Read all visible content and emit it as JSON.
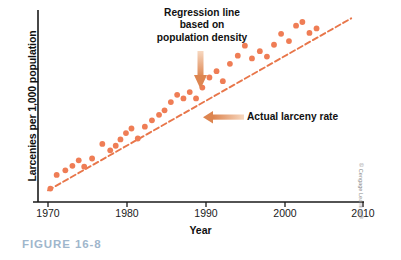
{
  "figure": {
    "caption": "FIGURE 16-8",
    "credit": "© Cengage Learning®"
  },
  "annotations": {
    "regression_line_label": "Regression line based on population density",
    "regression_line_label_line1": "Regression line",
    "regression_line_label_line2": "based on",
    "regression_line_label_line3": "population density",
    "actual_rate_label": "Actual larceny rate"
  },
  "colors": {
    "point": "#ef7d55",
    "line": "#e8764a",
    "arrow_start": "#f6d3ba",
    "arrow_end": "#e08a52",
    "axis": "#1a1a1a",
    "caption": "#9fb6cc",
    "text": "#111111"
  },
  "chart_data": {
    "type": "scatter",
    "title": "",
    "xlabel": "Year",
    "ylabel": "Larcenies per 1,000 population",
    "xlim": [
      1970,
      2010
    ],
    "ylim": [
      0,
      100
    ],
    "grid": false,
    "legend": "none",
    "xticks": [
      1970,
      1980,
      1990,
      2000,
      2010
    ],
    "xtick_labels": [
      "1970",
      "1980",
      "1990",
      "2000",
      "2010"
    ],
    "yticks": [],
    "ytick_labels": [],
    "series": [
      {
        "name": "Actual larceny rate",
        "type": "scatter",
        "x": [
          1970.3,
          1971.1,
          1972.2,
          1973.1,
          1973.9,
          1974.6,
          1975.6,
          1976.9,
          1977.9,
          1978.6,
          1979.2,
          1979.9,
          1980.6,
          1981.4,
          1982.3,
          1983.2,
          1984.1,
          1984.8,
          1985.6,
          1986.4,
          1987.2,
          1988.0,
          1988.8,
          1989.6,
          1990.5,
          1991.4,
          1992.2,
          1993.1,
          1994.1,
          1995.0,
          1995.9,
          1996.9,
          1997.8,
          1998.7,
          1999.6,
          2000.6,
          2001.5,
          2002.3,
          2003.2,
          2004.1
        ],
        "y": [
          3.0,
          10.5,
          13.0,
          15.5,
          18.5,
          15.0,
          19.5,
          27.5,
          24.0,
          26.5,
          30.0,
          33.5,
          36.0,
          30.5,
          37.0,
          40.5,
          43.5,
          46.0,
          50.5,
          54.5,
          52.5,
          56.0,
          52.5,
          58.5,
          64.0,
          67.5,
          62.0,
          71.5,
          76.0,
          81.5,
          74.5,
          78.5,
          75.5,
          82.0,
          88.0,
          84.0,
          92.5,
          94.5,
          88.5,
          91.0
        ]
      },
      {
        "name": "Regression line based on population density",
        "type": "line",
        "style": "dashed",
        "x": [
          1970.0,
          2008.5
        ],
        "y": [
          2.0,
          96.5
        ]
      }
    ]
  }
}
